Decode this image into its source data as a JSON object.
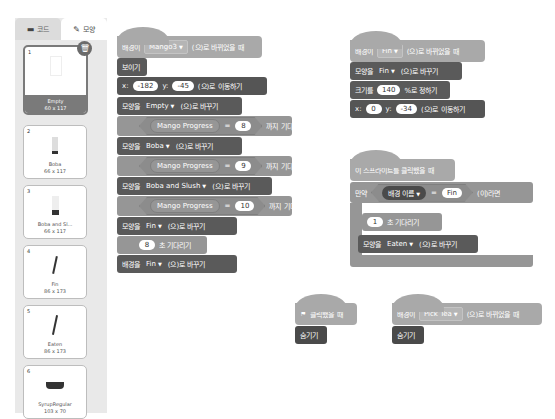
{
  "tabs": {
    "code": {
      "label": "코드",
      "icon": "code-icon"
    },
    "costume": {
      "label": "모양",
      "icon": "brush-icon"
    }
  },
  "costumes": [
    {
      "num": "1",
      "name": "Empty",
      "size": "60 x 117",
      "selected": true
    },
    {
      "num": "2",
      "name": "Boba",
      "size": "66 x 117"
    },
    {
      "num": "3",
      "name": "Boba and Sl...",
      "size": "66 x 117"
    },
    {
      "num": "4",
      "name": "Fin",
      "size": "86 x 173"
    },
    {
      "num": "5",
      "name": "Eaten",
      "size": "86 x 173"
    },
    {
      "num": "6",
      "name": "SyrupRegular",
      "size": "103 x 70"
    }
  ],
  "script1": {
    "hat": {
      "prefix": "배경이",
      "value": "Mango3",
      "suffix": "(으)로 바뀌었을 때"
    },
    "show": "보이기",
    "goto": {
      "x_label": "x:",
      "x": "-182",
      "y_label": "y:",
      "y": "-45",
      "suffix": "(으)로 이동하기"
    },
    "switch1": {
      "prefix": "모양을",
      "value": "Empty",
      "suffix": "(으)로 바꾸기"
    },
    "wait1": {
      "var": "Mango Progress",
      "op": "=",
      "value": "8",
      "suffix": "까지 기다리기"
    },
    "switch2": {
      "prefix": "모양을",
      "value": "Boba",
      "suffix": "(으)로 바꾸기"
    },
    "wait2": {
      "var": "Mango Progress",
      "op": "=",
      "value": "9",
      "suffix": "까지 기다리기"
    },
    "switch3": {
      "prefix": "모양을",
      "value": "Boba and Slush",
      "suffix": "(으)로 바꾸기"
    },
    "wait3": {
      "var": "Mango Progress",
      "op": "=",
      "value": "10",
      "suffix": "까지 기다리기"
    },
    "switch4": {
      "prefix": "모양을",
      "value": "Fin",
      "suffix": "(으)로 바꾸기"
    },
    "waitsec": {
      "value": "8",
      "suffix": "초 기다리기"
    },
    "backdrop": {
      "prefix": "배경을",
      "value": "Fin",
      "suffix": "(으)로 바꾸기"
    }
  },
  "script2": {
    "hat": {
      "prefix": "배경이",
      "value": "Fin",
      "suffix": "(으)로 바뀌었을 때"
    },
    "switch": {
      "prefix": "모양을",
      "value": "Fin",
      "suffix": "(으)로 바꾸기"
    },
    "size": {
      "prefix": "크기를",
      "value": "140",
      "suffix": "%로 정하기"
    },
    "goto": {
      "x_label": "x:",
      "x": "0",
      "y_label": "y:",
      "y": "-34",
      "suffix": "(으)로 이동하기"
    }
  },
  "script3": {
    "hat": "이 스프라이트를 클릭했을 때",
    "if": {
      "prefix": "만약",
      "reporter": "배경",
      "reporter_value": "이름",
      "op": "=",
      "value": "Fin",
      "suffix": "(이)라면"
    },
    "wait": {
      "value": "1",
      "suffix": "초 기다리기"
    },
    "switch": {
      "prefix": "모양을",
      "value": "Eaten",
      "suffix": "(으)로 바꾸기"
    }
  },
  "script4": {
    "hat": "클릭했을 때",
    "hide": "숨기기"
  },
  "script5": {
    "hat": {
      "prefix": "배경이",
      "value": "Pick Tea",
      "suffix": "(으)로 바뀌었을 때"
    },
    "hide": "숨기기"
  }
}
